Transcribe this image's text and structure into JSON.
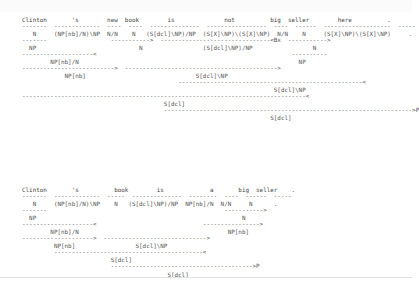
{
  "derivations": [
    {
      "sentence": "Clinton 's new book is not big seller here .",
      "lines": [
        {
          "x": 22,
          "y": 16,
          "text": "Clinton       's        new  book        is              not          big  seller        here          ."
        },
        {
          "x": 22,
          "y": 22,
          "text": "-------  -------------  ----  ----  --------------  -----------------  ----  ------  -------------------  -----"
        },
        {
          "x": 22,
          "y": 30,
          "text": "   N     (NP[nb]/N)\\NP  N/N    N   (S[dcl]\\NP)/NP  (S[X]\\NP)\\(S[X]\\NP)  N/N    N     (S[X]\\NP)\\(S[X]\\NP)     ."
        },
        {
          "x": 22,
          "y": 36,
          "text": "-------                  ----------->  -------------------------------<Bx  ----------->"
        },
        {
          "x": 22,
          "y": 44,
          "text": "  NP                             N                 (S[dcl]\\NP)/NP                 N"
        },
        {
          "x": 22,
          "y": 50,
          "text": "--------------------<                                                       ----------"
        },
        {
          "x": 22,
          "y": 58,
          "text": "        NP[nb]/N                                                              NP"
        },
        {
          "x": 22,
          "y": 64,
          "text": "-------------------------->  ------------------------------------------->"
        },
        {
          "x": 22,
          "y": 72,
          "text": "            NP[nb]                               S[dcl]\\NP"
        },
        {
          "x": 22,
          "y": 78,
          "text": "                                            ----------------------------------------------------<"
        },
        {
          "x": 22,
          "y": 86,
          "text": "                                                                       S[dcl]\\NP"
        },
        {
          "x": 22,
          "y": 92,
          "text": "--------------------------------------------------------------------------------<"
        },
        {
          "x": 22,
          "y": 100,
          "text": "                                        S[dcl]"
        },
        {
          "x": 22,
          "y": 106,
          "text": "                                        ---------------------------------------------------------------------->P"
        },
        {
          "x": 22,
          "y": 114,
          "text": "                                                                      S[dcl]"
        }
      ]
    },
    {
      "sentence": "Clinton 's book is a big seller .",
      "lines": [
        {
          "x": 22,
          "y": 186,
          "text": "Clinton       's          book        is             a       big  seller    ."
        },
        {
          "x": 22,
          "y": 192,
          "text": "-------  -------------  -----  --------------  --------  ----  ------  -----"
        },
        {
          "x": 22,
          "y": 200,
          "text": "   N     (NP[nb]/N)\\NP    N   (S[dcl]\\NP)/NP  NP[nb]/N  N/N     N      ."
        },
        {
          "x": 22,
          "y": 206,
          "text": "-------                                                  ----------->"
        },
        {
          "x": 22,
          "y": 214,
          "text": "  NP                                                          N"
        },
        {
          "x": 22,
          "y": 220,
          "text": "--------------------<                              ---------------->"
        },
        {
          "x": 22,
          "y": 228,
          "text": "        NP[nb]/N                                          NP[nb]"
        },
        {
          "x": 22,
          "y": 234,
          "text": "-------------------->  ----------------------------->"
        },
        {
          "x": 22,
          "y": 242,
          "text": "         NP[nb]                 S[dcl]\\NP"
        },
        {
          "x": 22,
          "y": 248,
          "text": "         ------------------------------------------<"
        },
        {
          "x": 22,
          "y": 256,
          "text": "                         S[dcl]"
        },
        {
          "x": 22,
          "y": 262,
          "text": "                         ---------------------------------------->P"
        },
        {
          "x": 22,
          "y": 271,
          "text": "                                         S[dcl]"
        }
      ]
    }
  ]
}
